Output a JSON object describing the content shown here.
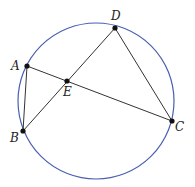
{
  "diagram": {
    "circle": {
      "cx": 96,
      "cy": 101,
      "r": 78,
      "color": "#4a5fb0"
    },
    "line_color": "#333333",
    "points": {
      "A": {
        "x": 27,
        "y": 66,
        "label": "A",
        "lx": 11,
        "ly": 70
      },
      "B": {
        "x": 23,
        "y": 131,
        "label": "B",
        "lx": 10,
        "ly": 142
      },
      "C": {
        "x": 172,
        "y": 121,
        "label": "C",
        "lx": 175,
        "ly": 131
      },
      "D": {
        "x": 115,
        "y": 28,
        "label": "D",
        "lx": 111,
        "ly": 20
      },
      "E": {
        "x": 67,
        "y": 81,
        "label": "E",
        "lx": 63,
        "ly": 96
      }
    },
    "segments": [
      [
        "A",
        "B"
      ],
      [
        "A",
        "C"
      ],
      [
        "B",
        "D"
      ],
      [
        "D",
        "C"
      ]
    ]
  }
}
